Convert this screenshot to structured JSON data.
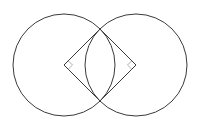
{
  "diagram": {
    "colors": {
      "stroke": "#3a3a3a",
      "marker": "#9a9a9a",
      "background": "#ffffff"
    },
    "circles": [
      {
        "name": "left-circle",
        "cx": 64,
        "cy": 65,
        "r": 51
      },
      {
        "name": "right-circle",
        "cx": 136,
        "cy": 65,
        "r": 51
      }
    ],
    "square": {
      "vertices": [
        {
          "name": "left-center",
          "x": 64,
          "y": 65
        },
        {
          "name": "top-intersection",
          "x": 100,
          "y": 29
        },
        {
          "name": "right-center",
          "x": 136,
          "y": 65
        },
        {
          "name": "bottom-intersection",
          "x": 100,
          "y": 101
        }
      ]
    },
    "right_angle_markers": [
      {
        "name": "left-right-angle",
        "vertex": "left-center",
        "size": 6
      },
      {
        "name": "right-right-angle",
        "vertex": "right-center",
        "size": 6
      }
    ]
  }
}
